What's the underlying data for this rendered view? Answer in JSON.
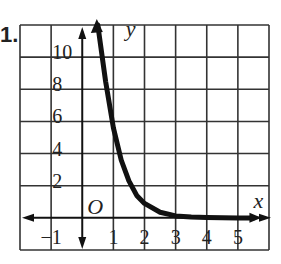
{
  "problem_number": "1.",
  "chart_data": {
    "type": "line",
    "title": "",
    "xlabel": "x",
    "ylabel": "y",
    "origin_label": "O",
    "xlim": [
      -2,
      6
    ],
    "ylim": [
      -2,
      12
    ],
    "x_ticks": [
      -1,
      1,
      2,
      3,
      4,
      5
    ],
    "x_tick_labels": [
      "−1",
      "1",
      "2",
      "3",
      "4",
      "5"
    ],
    "y_ticks": [
      2,
      4,
      6,
      8,
      10
    ],
    "y_tick_labels": [
      "2",
      "4",
      "6",
      "8",
      "10"
    ],
    "grid": true,
    "grid_x_step": 1,
    "grid_y_step": 2,
    "series": [
      {
        "name": "exponential decay curve",
        "points": [
          [
            0.5,
            12
          ],
          [
            0.75,
            8.5
          ],
          [
            1,
            5.6
          ],
          [
            1.25,
            3.6
          ],
          [
            1.5,
            2.3
          ],
          [
            1.75,
            1.4
          ],
          [
            2,
            0.9
          ],
          [
            2.5,
            0.35
          ],
          [
            3,
            0.12
          ],
          [
            3.5,
            0.05
          ],
          [
            4,
            0.02
          ],
          [
            5,
            0
          ],
          [
            5.5,
            0
          ]
        ]
      }
    ],
    "colors": {
      "curve": "#111111",
      "grid": "#333333",
      "axis": "#111111"
    }
  }
}
